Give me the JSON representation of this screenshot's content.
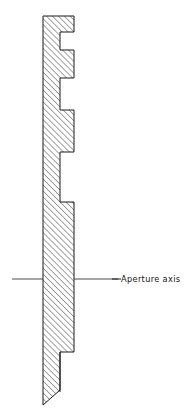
{
  "figure": {
    "kind": "engineering-cross-section",
    "background_color": "#ffffff",
    "line_color": "#1a1a1a",
    "hatch_color": "#1a1a1a"
  },
  "annotations": {
    "aperture_axis_label": "Aperture axis"
  },
  "chart_data": {
    "type": "line",
    "xlabel": "",
    "ylabel": "",
    "xlim": [
      0,
      192
    ],
    "ylim": [
      413,
      0
    ],
    "grid": false,
    "legend": "none",
    "annotations": [
      {
        "text": "Aperture axis",
        "x": 120,
        "y": 279,
        "leader_from_x": 74,
        "leader_to_x": 118,
        "leader_y": 279
      }
    ],
    "series": [
      {
        "name": "plate-section-outline",
        "closed": false,
        "x": [
          43,
          74,
          74,
          60,
          60,
          74,
          74,
          60,
          60,
          74,
          74,
          60,
          60,
          74,
          74,
          60,
          60,
          43
        ],
        "y": [
          16,
          16,
          32,
          32,
          50,
          50,
          78,
          78,
          110,
          110,
          152,
          152,
          202,
          202,
          352,
          352,
          390,
          405
        ]
      },
      {
        "name": "aperture-axis-left",
        "x": [
          12,
          43
        ],
        "y": [
          279,
          279
        ]
      },
      {
        "name": "aperture-axis-right",
        "x": [
          74,
          118
        ],
        "y": [
          279,
          279
        ]
      }
    ],
    "hatching": {
      "angle_deg": 45,
      "spacing_px": 4.2,
      "stroke_width": 0.8,
      "direction": "lower-left-to-upper-right"
    },
    "geometry_notes": {
      "plate_left_edge_x": 43,
      "plate_right_edge_x": 74,
      "notch_inner_x": 60,
      "plate_top_y": 16,
      "plate_bottom_y": 405,
      "notches": [
        {
          "top_y": 32,
          "bottom_y": 50
        },
        {
          "top_y": 78,
          "bottom_y": 110
        },
        {
          "top_y": 152,
          "bottom_y": 202
        }
      ],
      "bottom_step_y": 352,
      "bottom_thin_line_end_y": 390,
      "axis_y": 279
    }
  }
}
